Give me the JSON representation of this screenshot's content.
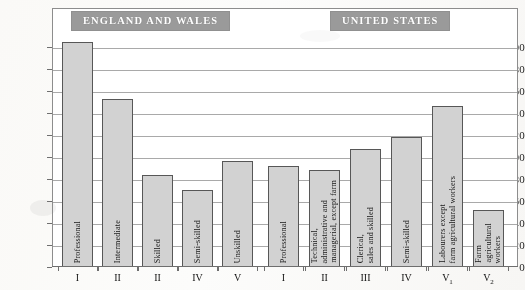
{
  "banners": {
    "left": "ENGLAND AND WALES",
    "right": "UNITED STATES"
  },
  "chart_data": {
    "type": "bar",
    "title": "",
    "subtitle": "",
    "xlabel": "",
    "ylabel": "",
    "ylim": [
      0,
      210
    ],
    "grid": true,
    "legend_position": "none",
    "yticks": [
      0,
      20,
      40,
      60,
      80,
      100,
      120,
      140,
      160,
      180,
      200
    ],
    "ytick_labels": [
      "0",
      "20",
      "40",
      "60",
      "80",
      "100",
      "120",
      "140",
      "160",
      "180",
      "200"
    ],
    "groups": [
      {
        "name": "ENGLAND AND WALES",
        "categories": [
          "I",
          "II",
          "II",
          "IV",
          "V"
        ],
        "category_names": [
          "Professional",
          "Intermediate",
          "Skilled",
          "Semi-skilled",
          "Unskilled"
        ],
        "values": [
          205,
          153,
          84,
          70,
          96
        ]
      },
      {
        "name": "UNITED STATES",
        "categories": [
          "I",
          "II",
          "III",
          "IV",
          "V1",
          "V2"
        ],
        "category_names": [
          "Professional",
          "Technical, administrative and managerial, except farm",
          "Clerical, sales and skilled",
          "Semi-skilled",
          "Labourers except farm agricultural workers",
          "Farm agricultural workers"
        ],
        "values": [
          92,
          88,
          107,
          118,
          146,
          52
        ]
      }
    ],
    "bars": [
      {
        "group": "ENGLAND AND WALES",
        "numeral": "I",
        "numeral_sub": "",
        "label_lines": [
          "Professional"
        ],
        "value": 205
      },
      {
        "group": "ENGLAND AND WALES",
        "numeral": "II",
        "numeral_sub": "",
        "label_lines": [
          "Intermediate"
        ],
        "value": 153
      },
      {
        "group": "ENGLAND AND WALES",
        "numeral": "II",
        "numeral_sub": "",
        "label_lines": [
          "Skilled"
        ],
        "value": 84
      },
      {
        "group": "ENGLAND AND WALES",
        "numeral": "IV",
        "numeral_sub": "",
        "label_lines": [
          "Semi-skilled"
        ],
        "value": 70
      },
      {
        "group": "ENGLAND AND WALES",
        "numeral": "V",
        "numeral_sub": "",
        "label_lines": [
          "Unskilled"
        ],
        "value": 96
      },
      {
        "group": "UNITED STATES",
        "numeral": "I",
        "numeral_sub": "",
        "label_lines": [
          "Professional"
        ],
        "value": 92
      },
      {
        "group": "UNITED STATES",
        "numeral": "II",
        "numeral_sub": "",
        "label_lines": [
          "Technical,",
          "administrative and",
          "managerial, except farm"
        ],
        "value": 88
      },
      {
        "group": "UNITED STATES",
        "numeral": "III",
        "numeral_sub": "",
        "label_lines": [
          "Clerical,",
          "sales and skilled"
        ],
        "value": 107
      },
      {
        "group": "UNITED STATES",
        "numeral": "IV",
        "numeral_sub": "",
        "label_lines": [
          "Semi-skilled"
        ],
        "value": 118
      },
      {
        "group": "UNITED STATES",
        "numeral": "V",
        "numeral_sub": "1",
        "label_lines": [
          "Labourers except",
          "farm agricultural workers"
        ],
        "value": 146
      },
      {
        "group": "UNITED STATES",
        "numeral": "V",
        "numeral_sub": "2",
        "label_lines": [
          "Farm",
          "agricultural",
          "workers"
        ],
        "value": 52
      }
    ]
  },
  "colors": {
    "bar_fill": "#d2d2d2",
    "bar_stroke": "#575757",
    "banner_bg": "#9a9a9a",
    "banner_text": "#ffffff",
    "gridline": "#a9a9a9",
    "frame": "#8d8d8d",
    "page_bg": "#fbfaf7"
  }
}
